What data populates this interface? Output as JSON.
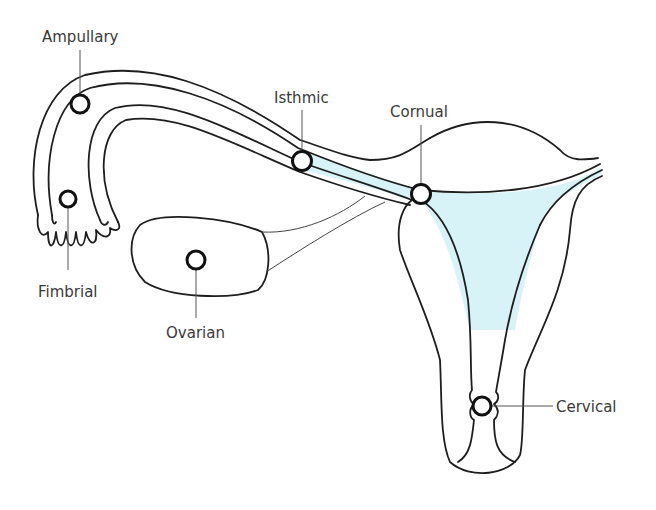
{
  "diagram": {
    "colors": {
      "line": "#1e1e1e",
      "cavity_fill": "#d8f3f8",
      "label": "#3a3a3a",
      "background": "#ffffff"
    },
    "labels": {
      "ampullary": "Ampullary",
      "fimbrial": "Fimbrial",
      "isthmic": "Isthmic",
      "cornual": "Cornual",
      "ovarian": "Ovarian",
      "cervical": "Cervical"
    },
    "sites": [
      {
        "name": "Ampullary",
        "marker_x": 80,
        "marker_y": 104,
        "label_x": 42,
        "label_y": 42
      },
      {
        "name": "Fimbrial",
        "marker_x": 68,
        "marker_y": 199,
        "label_x": 38,
        "label_y": 297
      },
      {
        "name": "Isthmic",
        "marker_x": 302,
        "marker_y": 161,
        "label_x": 274,
        "label_y": 103
      },
      {
        "name": "Cornual",
        "marker_x": 421,
        "marker_y": 194,
        "label_x": 390,
        "label_y": 117
      },
      {
        "name": "Ovarian",
        "marker_x": 196,
        "marker_y": 260,
        "label_x": 166,
        "label_y": 338
      },
      {
        "name": "Cervical",
        "marker_x": 482,
        "marker_y": 406,
        "label_x": 556,
        "label_y": 412
      }
    ]
  }
}
